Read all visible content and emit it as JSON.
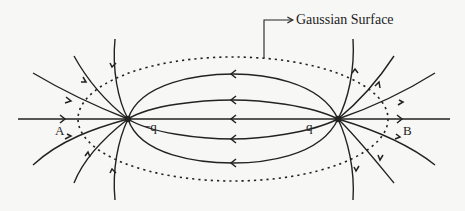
{
  "diagram": {
    "callout_label": "Gaussian Surface",
    "charges": [
      {
        "label": "−q",
        "sign": "negative",
        "x": 128,
        "y": 119
      },
      {
        "label": "q",
        "sign": "positive",
        "x": 338,
        "y": 119
      }
    ],
    "points": [
      {
        "label": "A",
        "x": 61,
        "y": 130
      },
      {
        "label": "B",
        "x": 405,
        "y": 130
      }
    ],
    "gaussian_surface": {
      "shape": "ellipse",
      "style": "dotted",
      "cx": 233,
      "cy": 119,
      "rx": 155,
      "ry": 62
    },
    "colors": {
      "line": "#222222",
      "background": "#f7f7f5"
    }
  }
}
